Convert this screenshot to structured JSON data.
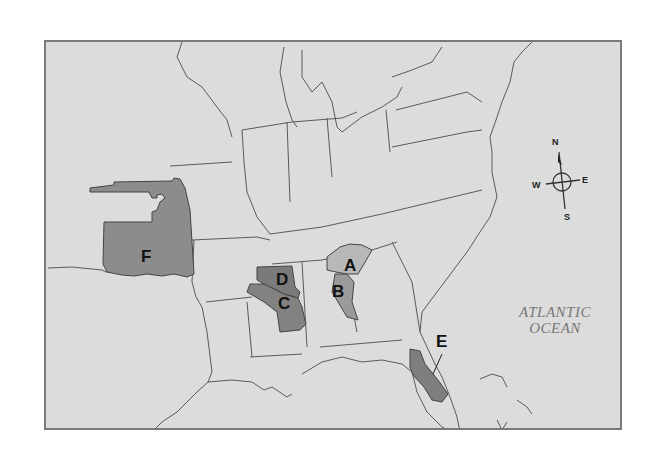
{
  "map": {
    "title": "",
    "ocean_label_line1": "ATLANTIC",
    "ocean_label_line2": "OCEAN",
    "regions": [
      {
        "id": "A",
        "label": "A",
        "shade": "light"
      },
      {
        "id": "B",
        "label": "B",
        "shade": "medium"
      },
      {
        "id": "C",
        "label": "C",
        "shade": "dark"
      },
      {
        "id": "D",
        "label": "D",
        "shade": "dark"
      },
      {
        "id": "E",
        "label": "E",
        "shade": "dark"
      },
      {
        "id": "F",
        "label": "F",
        "shade": "medium"
      }
    ],
    "compass": {
      "n": "N",
      "s": "S",
      "e": "E",
      "w": "W"
    },
    "colors": {
      "background": "#dcdcdc",
      "border": "#7a7a7a",
      "region_dark": "#8a8a8a",
      "region_light": "#b8b8b8",
      "lines": "#5a5a5a"
    }
  }
}
